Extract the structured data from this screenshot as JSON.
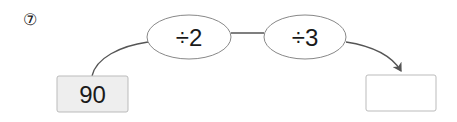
{
  "problem": {
    "number_label": "⑦",
    "start_value": "90",
    "operations": [
      {
        "label": "÷2"
      },
      {
        "label": "÷3"
      }
    ],
    "answer_value": ""
  },
  "colors": {
    "line": "#555555",
    "ellipse_border": "#888888",
    "start_box_fill": "#eeeeee",
    "box_border": "#bbbbbb",
    "text": "#1a1a1a"
  }
}
